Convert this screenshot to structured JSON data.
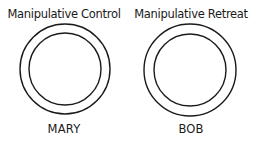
{
  "figures": [
    {
      "title": "Manipulative Control",
      "name": "MARY",
      "outer_circle": {
        "cx": 65,
        "cy": 69,
        "r": 45
      },
      "inner_circle": {
        "cx": 65,
        "cy": 69,
        "r": 36
      }
    },
    {
      "title": "Manipulative Retreat",
      "name": "BOB",
      "outer_circle": {
        "cx": 63,
        "cy": 70,
        "r": 46
      },
      "inner_circle": {
        "cx": 63,
        "cy": 70,
        "r": 36
      }
    }
  ],
  "colors": {
    "stroke": "#1a1a1a",
    "background": "#ffffff"
  }
}
